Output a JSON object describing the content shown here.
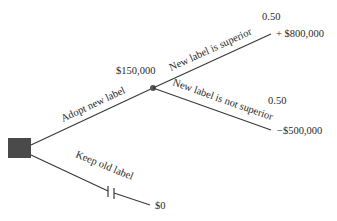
{
  "diagram": {
    "type": "decision-tree",
    "colors": {
      "line": "#3a3a3a",
      "decision_node": "#4a4a4a",
      "chance_node": "#555555",
      "text": "#2a2a2a",
      "background": "#ffffff"
    },
    "decision_node": {
      "shape": "square",
      "icon": "decision-square-icon"
    },
    "branches": {
      "adopt": {
        "label": "Adopt new label",
        "expected_value": "$150,000",
        "chance_node": {
          "shape": "circle",
          "icon": "chance-node-icon",
          "outcomes": [
            {
              "label": "New label is superior",
              "probability": "0.50",
              "payoff": "+ $800,000"
            },
            {
              "label": "New label is not superior",
              "probability": "0.50",
              "payoff": "−$500,000"
            }
          ]
        }
      },
      "keep": {
        "label": "Keep old label",
        "pruned": true,
        "prune_marker": "double-bar-icon",
        "payoff": "$0"
      }
    }
  }
}
